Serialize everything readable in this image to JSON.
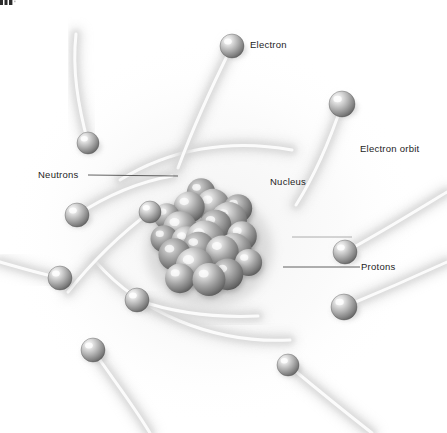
{
  "figure": {
    "type": "scientific-illustration",
    "background_color": "#ffffff",
    "width": 447,
    "height": 433
  },
  "labels": [
    {
      "id": "electron",
      "text": "Electron",
      "x": 250,
      "y": 40,
      "anchor": "left",
      "has_leader": false
    },
    {
      "id": "electron_orbit",
      "text": "Electron orbit",
      "x": 360,
      "y": 144,
      "anchor": "left",
      "has_leader": false
    },
    {
      "id": "neutrons",
      "text": "Neutrons",
      "x": 38,
      "y": 170,
      "anchor": "left",
      "has_leader": true
    },
    {
      "id": "nucleus",
      "text": "Nucleus",
      "x": 270,
      "y": 177,
      "anchor": "left",
      "has_leader": false
    },
    {
      "id": "protons",
      "text": "Protons",
      "x": 361,
      "y": 262,
      "anchor": "left",
      "has_leader": true
    }
  ],
  "leader_lines": [
    {
      "id": "neutrons-leader",
      "x1": 88,
      "y1": 175,
      "x2": 178,
      "y2": 176,
      "color": "#3a3a3a"
    },
    {
      "id": "protons-leader",
      "x1": 283,
      "y1": 267,
      "x2": 360,
      "y2": 267,
      "color": "#3a3a3a"
    },
    {
      "id": "nucleus-leader",
      "x1": 292,
      "y1": 237,
      "x2": 352,
      "y2": 237,
      "color": "#9a9a9a"
    }
  ],
  "colors": {
    "sphere_light": "#f2f2f2",
    "sphere_mid": "#b2b2b2",
    "sphere_dark": "#6e6e6e",
    "sphere_edge": "#4a4a4a",
    "nucleon_light": "#ededed",
    "nucleon_mid": "#9d9d9d",
    "nucleon_dark": "#5c5c5c",
    "orbit_trail": "#d9d9d9",
    "orbit_shadow": "#c9c9c9",
    "label_text": "#1d1d1d",
    "background": "#ffffff"
  },
  "nucleus": {
    "center_x": 205,
    "center_y": 240,
    "radius": 66,
    "nucleon_count": 21,
    "description": "Dense packed cluster of grey spheres representing protons and neutrons"
  },
  "electrons": [
    {
      "id": "e1",
      "cx": 232,
      "cy": 46,
      "r": 12
    },
    {
      "id": "e2",
      "cx": 342,
      "cy": 104,
      "r": 13
    },
    {
      "id": "e3",
      "cx": 88,
      "cy": 143,
      "r": 11
    },
    {
      "id": "e4",
      "cx": 77,
      "cy": 215,
      "r": 12
    },
    {
      "id": "e5",
      "cx": 60,
      "cy": 278,
      "r": 12
    },
    {
      "id": "e6",
      "cx": 93,
      "cy": 350,
      "r": 12
    },
    {
      "id": "e7",
      "cx": 137,
      "cy": 300,
      "r": 12
    },
    {
      "id": "e8",
      "cx": 288,
      "cy": 365,
      "r": 11
    },
    {
      "id": "e9",
      "cx": 345,
      "cy": 252,
      "r": 12
    },
    {
      "id": "e10",
      "cx": 344,
      "cy": 307,
      "r": 13
    },
    {
      "id": "e11",
      "cx": 150,
      "cy": 212,
      "r": 11
    }
  ],
  "orbit_trails": [
    {
      "id": "t1",
      "path": "M232,46 C215,80 196,120 178,168"
    },
    {
      "id": "t2",
      "path": "M342,104 C330,140 315,175 296,205"
    },
    {
      "id": "t3",
      "path": "M88,143 C78,105 72,70 76,34"
    },
    {
      "id": "t4",
      "path": "M77,215 C106,196 138,182 172,176"
    },
    {
      "id": "t5",
      "path": "M60,278 C34,272 14,266 0,262"
    },
    {
      "id": "t6",
      "path": "M93,350 C112,378 132,403 150,433"
    },
    {
      "id": "t7",
      "path": "M137,300 C172,312 214,318 258,316"
    },
    {
      "id": "t8",
      "path": "M288,365 C318,390 345,412 372,433"
    },
    {
      "id": "t9",
      "path": "M345,252 C382,232 414,212 447,192"
    },
    {
      "id": "t10",
      "path": "M344,307 C380,292 412,278 447,262"
    },
    {
      "id": "t11",
      "path": "M150,212 C118,236 92,262 68,292"
    },
    {
      "id": "t12",
      "path": "M120,180 C168,150 228,138 292,150"
    },
    {
      "id": "t13",
      "path": "M96,262 C140,312 212,344 290,340"
    }
  ],
  "icons": {
    "sphere": "sphere-icon",
    "orbit": "orbit-trail-icon",
    "nucleus": "nucleus-cluster-icon"
  }
}
